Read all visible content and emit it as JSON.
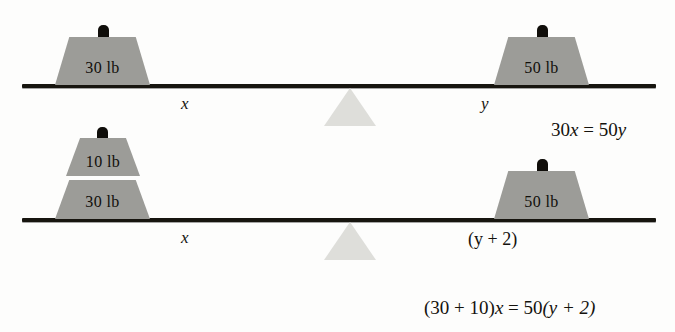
{
  "figure": {
    "background_color": "#fdfdfc",
    "bar_color": "#17150f",
    "weight_fill_color": "#9c9c98",
    "fulcrum_color": "#dcdcd8",
    "text_color": "#14120d"
  },
  "diagrams": [
    {
      "id": "top",
      "weights": {
        "left": [
          {
            "label": "30 lb"
          }
        ],
        "right": [
          {
            "label": "50 lb"
          }
        ]
      },
      "distance_labels": {
        "left": "x",
        "right": "y"
      },
      "equation": "30x = 50y"
    },
    {
      "id": "bottom",
      "weights": {
        "left": [
          {
            "label": "10 lb"
          },
          {
            "label": "30 lb"
          }
        ],
        "right": [
          {
            "label": "50 lb"
          }
        ]
      },
      "distance_labels": {
        "left": "x",
        "right": "(y + 2)"
      },
      "equation": "(30 + 10)x = 50(y + 2)"
    }
  ],
  "equations": {
    "top": {
      "full": "30x = 50y",
      "lhs_coefficient": "30",
      "lhs_variable": "x",
      "relation": "=",
      "rhs_coefficient": "50",
      "rhs_variable": "y"
    },
    "bottom": {
      "full": "(30 + 10)x = 50(y + 2)",
      "lhs": "(30 + 10)",
      "lhs_variable": "x",
      "relation": "=",
      "rhs_coefficient": "50",
      "rhs_group": "(y + 2)"
    }
  },
  "labels": {
    "weight_30_lb": "30 lb",
    "weight_50_lb": "50 lb",
    "weight_10_lb": "10 lb",
    "distance_x": "x",
    "distance_y": "y",
    "distance_y_plus_2": "(y + 2)"
  }
}
